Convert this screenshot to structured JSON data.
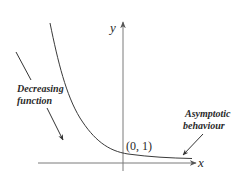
{
  "diagram": {
    "title": "",
    "axes": {
      "x_label": "x",
      "y_label": "y"
    },
    "point_label": "(0, 1)",
    "annotations": {
      "decreasing": {
        "line1": "Decreasing",
        "line2": "function"
      },
      "asymptotic": {
        "line1": "Asymptotic",
        "line2": "behaviour"
      }
    },
    "colors": {
      "axis": "#7a7a7a",
      "curve": "#3a3a3a",
      "text": "#2a2a2a",
      "background": "#ffffff"
    }
  }
}
